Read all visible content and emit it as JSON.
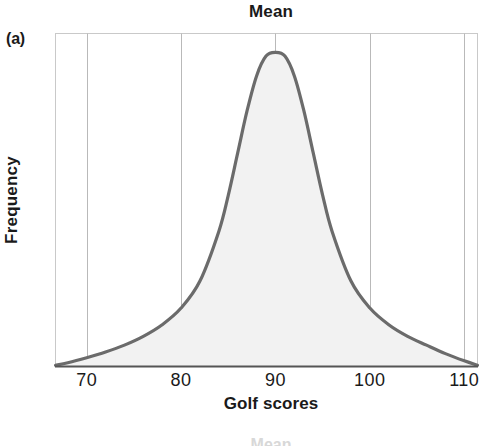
{
  "panel": {
    "label": "(a)"
  },
  "chart_data": {
    "type": "line",
    "title": "Mean",
    "xlabel": "Golf scores",
    "ylabel": "Frequency",
    "xlim": [
      66.7,
      111.4
    ],
    "ylim": [
      0,
      1.06
    ],
    "grid": true,
    "grid_axis": "x",
    "legend": null,
    "annotations": [
      {
        "text": "Mean",
        "x": 90,
        "placement": "above-plot-top",
        "note": "title marks the mean of the distribution at x = 90"
      }
    ],
    "xticks": [
      70,
      80,
      90,
      100,
      110
    ],
    "xticklabels": [
      "70",
      "80",
      "90",
      "100",
      "110"
    ],
    "yticks": [],
    "yticklabels": [],
    "series": [
      {
        "name": "Golf score distribution",
        "fill": true,
        "fill_color": "#f2f2f2",
        "line_color": "#6b6b6b",
        "line_width": 3.2,
        "description": "Symmetric unimodal heavy-tailed bell curve centred on the mean of 90",
        "x": [
          66.7,
          68,
          70,
          72,
          74,
          76,
          78,
          80,
          82,
          84,
          85,
          86,
          87,
          88,
          89,
          90,
          91,
          92,
          93,
          94,
          95,
          96,
          98,
          100,
          102,
          104,
          106,
          108,
          110,
          111.4
        ],
        "y": [
          0.004,
          0.012,
          0.028,
          0.046,
          0.068,
          0.096,
          0.133,
          0.186,
          0.272,
          0.43,
          0.545,
          0.68,
          0.815,
          0.925,
          0.988,
          1.0,
          0.988,
          0.925,
          0.815,
          0.68,
          0.545,
          0.43,
          0.272,
          0.186,
          0.133,
          0.096,
          0.068,
          0.041,
          0.018,
          0.004
        ]
      }
    ],
    "colors": {
      "curve": "#6b6b6b",
      "fill": "#f2f2f2",
      "grid": "#b9b9b9",
      "frame": "#c9c9c9",
      "axis": "#555555",
      "text": "#1a1a1a"
    }
  },
  "bottom_artifact": {
    "text": "Mean"
  }
}
